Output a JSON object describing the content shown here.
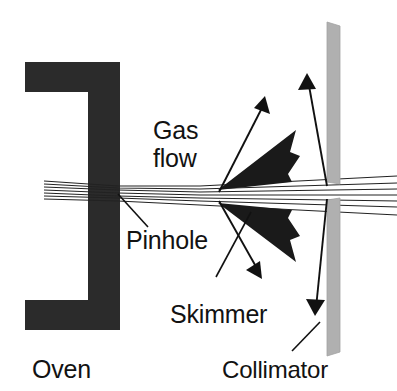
{
  "figure": {
    "background_color": "#ffffff",
    "width": 397,
    "height": 391
  },
  "colors": {
    "oven_fill": "#2b2b2b",
    "skimmer_fill": "#1a1a1a",
    "collimator_fill": "#b0b0b0",
    "beam_line": "#222222",
    "arrow": "#111111",
    "text": "#121212"
  },
  "labels": {
    "gas_flow_line1": "Gas",
    "gas_flow_line2": "flow",
    "pinhole": "Pinhole",
    "skimmer": "Skimmer",
    "oven": "Oven",
    "collimator": "Collimator"
  },
  "components": {
    "oven": {
      "name": "Oven",
      "shape": "C-bracket",
      "description": "Dark filled bracket enclosing the heated source region on the left"
    },
    "pinhole": {
      "name": "Pinhole",
      "description": "Small aperture in the right wall of the oven where the effusive gas exits"
    },
    "skimmer": {
      "name": "Skimmer",
      "shape": "wedge-pair",
      "description": "Two dark wedges above and below the axis that skim the beam edges"
    },
    "collimator": {
      "name": "Collimator",
      "shape": "vertical-slit-bar",
      "description": "Vertical grey bars with a narrow gap on the beam axis at the right"
    },
    "gas_flow": {
      "name": "Gas flow",
      "description": "Arrows indicating pumped-away gas diverging from the beam axis"
    }
  },
  "beam": {
    "line_count": 7,
    "description": "Bundle of nearly parallel trajectories converging at the pinhole then fanning out to the right"
  }
}
